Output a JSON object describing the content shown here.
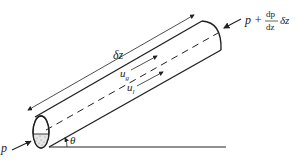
{
  "diagram": {
    "type": "inclined-pipe-two-phase-flow",
    "labels": {
      "inlet_pressure": "p",
      "outlet_pressure_prefix": "p +",
      "outlet_fraction_num": "dp",
      "outlet_fraction_den": "dz",
      "outlet_suffix": "δz",
      "length": "δz",
      "gas_velocity_base": "u",
      "gas_velocity_sub": "g",
      "liquid_velocity_base": "u",
      "liquid_velocity_sub": "l",
      "angle": "θ"
    },
    "colors": {
      "stroke": "#222222",
      "background": "#ffffff"
    }
  }
}
